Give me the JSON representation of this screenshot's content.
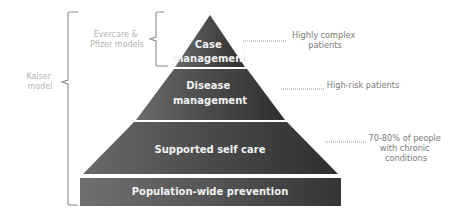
{
  "diagram": {
    "colors": {
      "tier_fill_dark": "#3a3a3a",
      "tier_fill_mid": "#555555",
      "tier_text": "#f2f2f2",
      "annotation_text": "#7a7a7a",
      "model_text": "#b5b5b5",
      "bracket_stroke": "#8a8a8a",
      "background": "#ffffff"
    },
    "tiers": [
      {
        "line1": "Case",
        "line2": "management",
        "annotation_line1": "Highly complex",
        "annotation_line2": "patients",
        "annotation_line3": ""
      },
      {
        "line1": "Disease",
        "line2": "management",
        "annotation_line1": "High-risk patients",
        "annotation_line2": "",
        "annotation_line3": ""
      },
      {
        "line1": "Supported self care",
        "line2": "",
        "annotation_line1": "70-80% of people",
        "annotation_line2": "with chronic",
        "annotation_line3": "conditions"
      },
      {
        "line1": "Population-wide prevention",
        "line2": ""
      }
    ],
    "models": [
      {
        "line1": "Evercare &",
        "line2": "Pfizer models"
      },
      {
        "line1": "Kaiser",
        "line2": "model"
      }
    ]
  }
}
